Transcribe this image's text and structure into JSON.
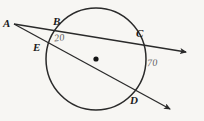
{
  "figure": {
    "background_color": "#f7f6f3",
    "stroke_color": "#2a2a2a",
    "label_color": "#1b1b1b",
    "number_color": "#5d5d5d"
  },
  "circle": {
    "center_x": 96,
    "center_y": 59,
    "radius": 50,
    "center_dot_label": "center-point"
  },
  "points": [
    {
      "id": "A",
      "label": "A",
      "x": 14,
      "y": 24,
      "role": "external-vertex"
    },
    {
      "id": "B",
      "label": "B",
      "x": 62,
      "y": 31,
      "role": "near-intersection-upper"
    },
    {
      "id": "C",
      "label": "C",
      "x": 138,
      "y": 46,
      "role": "far-intersection-upper"
    },
    {
      "id": "E",
      "label": "E",
      "x": 45,
      "y": 48,
      "role": "near-intersection-lower"
    },
    {
      "id": "D",
      "label": "D",
      "x": 136,
      "y": 98,
      "role": "far-intersection-lower"
    }
  ],
  "rays": [
    {
      "id": "upper-secant",
      "from": "A",
      "through": [
        "B",
        "C"
      ],
      "arrow_x": 190,
      "arrow_y": 54
    },
    {
      "id": "lower-secant",
      "from": "A",
      "through": [
        "E",
        "D"
      ],
      "arrow_x": 175,
      "arrow_y": 112
    }
  ],
  "annotations": {
    "arc_near": "20",
    "arc_far": "70"
  }
}
